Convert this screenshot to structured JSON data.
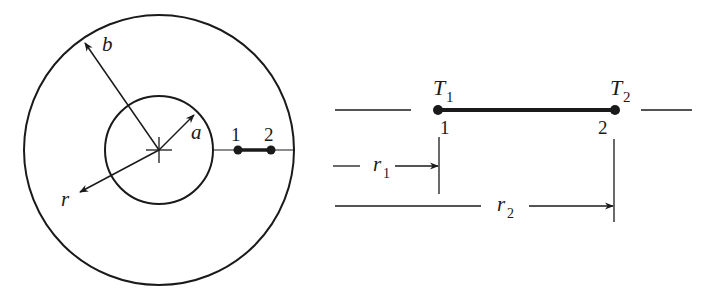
{
  "figure": {
    "left_diagram": {
      "description": "Cross-section of a hollow cylinder / annulus with inner radius a and outer radius b",
      "labels": {
        "outer_radius": "b",
        "inner_radius": "a",
        "radial_coord": "r",
        "point1": "1",
        "point2": "2"
      }
    },
    "right_diagram": {
      "description": "Radial element between nodes 1 and 2 with temperatures T1 and T2",
      "labels": {
        "T1_main": "T",
        "T1_sub": "1",
        "T2_main": "T",
        "T2_sub": "2",
        "node1": "1",
        "node2": "2",
        "r1_main": "r",
        "r1_sub": "1",
        "r2_main": "r",
        "r2_sub": "2"
      }
    },
    "colors": {
      "stroke": "#1a1a1a",
      "background": "#ffffff"
    }
  }
}
